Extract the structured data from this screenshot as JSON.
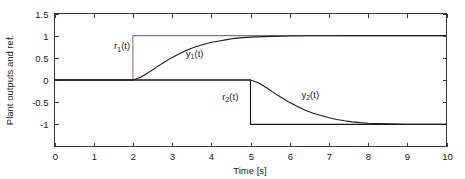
{
  "figure": {
    "background_color": "#ffffff",
    "axis_color": "#3a3a3a",
    "text_color": "#1a1a1a"
  },
  "chart_data": {
    "type": "line",
    "title": "",
    "subtitle": "",
    "xlabel": "Time [s]",
    "ylabel": "Plant outputs and ref.",
    "xlim": [
      0,
      10
    ],
    "ylim": [
      -1.5,
      1.5
    ],
    "xticks": [
      0,
      1,
      2,
      3,
      4,
      5,
      6,
      7,
      8,
      9,
      10
    ],
    "xtick_labels": [
      "0",
      "1",
      "2",
      "3",
      "4",
      "5",
      "6",
      "7",
      "8",
      "9",
      "10"
    ],
    "yticks": [
      1.5,
      1,
      0.5,
      0,
      -0.5,
      -1
    ],
    "ytick_labels": [
      "1.5",
      "1",
      "0.5",
      "0",
      "-0.5",
      "-1"
    ],
    "grid": false,
    "legend": "none",
    "annotations": [
      {
        "id": "r1",
        "text": "r",
        "sub": "1",
        "suffix": "(t)",
        "x": 1.52,
        "y": 0.7
      },
      {
        "id": "y1",
        "text": "y",
        "sub": "1",
        "suffix": "(t)",
        "x": 3.35,
        "y": 0.53
      },
      {
        "id": "r2",
        "text": "r",
        "sub": "2",
        "suffix": "(t)",
        "x": 4.28,
        "y": -0.44
      },
      {
        "id": "y2",
        "text": "y",
        "sub": "2",
        "suffix": "(t)",
        "x": 6.3,
        "y": -0.4
      }
    ],
    "series": [
      {
        "name": "r1(t)",
        "role": "reference-step-up",
        "color": "#8c6f96",
        "description": "Unit step reference rising from 0 to 1 at t = 2 s, held at 1 until t = 10 s",
        "step_time": 2.0,
        "initial_value": 0,
        "final_value": 1,
        "x": [
          0,
          2,
          2,
          10
        ],
        "values": [
          0,
          0,
          1,
          1
        ]
      },
      {
        "name": "y1(t)",
        "role": "plant-output-1",
        "color": "#1b1b1b",
        "description": "First-order-like rise from 0 at t = 2 s settling to 1 near t = 5 s",
        "x": [
          0,
          0.5,
          1,
          1.5,
          2,
          2.2,
          2.4,
          2.6,
          2.8,
          3,
          3.2,
          3.4,
          3.6,
          3.8,
          4,
          4.2,
          4.4,
          4.6,
          4.8,
          5,
          5.5,
          6,
          6.5,
          7,
          7.5,
          8,
          8.5,
          9,
          9.5,
          10
        ],
        "values": [
          0,
          0,
          0,
          0,
          0,
          0.06,
          0.17,
          0.29,
          0.4,
          0.51,
          0.6,
          0.68,
          0.75,
          0.8,
          0.85,
          0.88,
          0.91,
          0.94,
          0.955,
          0.968,
          0.985,
          0.993,
          0.997,
          0.999,
          1,
          1,
          1,
          1,
          1,
          1
        ]
      },
      {
        "name": "r2(t)",
        "role": "reference-step-down",
        "color": "#1b1b1b",
        "description": "Negative step reference dropping from 0 to -1 at t = 5 s, held at -1 until t = 10 s",
        "step_time": 5.0,
        "initial_value": 0,
        "final_value": -1,
        "x": [
          0,
          5,
          5,
          10
        ],
        "values": [
          0,
          0,
          -1,
          -1
        ]
      },
      {
        "name": "y2(t)",
        "role": "plant-output-2",
        "color": "#1b1b1b",
        "description": "First-order-like decay from 0 at t = 5 s settling to -1 near t = 8 s",
        "x": [
          0,
          1,
          2,
          3,
          4,
          5,
          5.2,
          5.4,
          5.6,
          5.8,
          6,
          6.2,
          6.4,
          6.6,
          6.8,
          7,
          7.2,
          7.4,
          7.6,
          7.8,
          8,
          8.5,
          9,
          9.5,
          10
        ],
        "values": [
          0,
          0,
          0,
          0,
          0,
          0,
          -0.06,
          -0.17,
          -0.29,
          -0.4,
          -0.51,
          -0.6,
          -0.68,
          -0.75,
          -0.8,
          -0.85,
          -0.89,
          -0.92,
          -0.945,
          -0.962,
          -0.975,
          -0.99,
          -0.997,
          -1,
          -1
        ]
      }
    ]
  }
}
